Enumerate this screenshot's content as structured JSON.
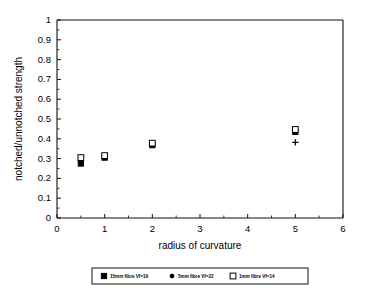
{
  "chart_data": {
    "type": "scatter",
    "title": "",
    "xlabel": "radius of curvature",
    "ylabel": "notched/unnotched strength",
    "xlim": [
      0,
      6
    ],
    "ylim": [
      0,
      1
    ],
    "xticks": [
      0,
      1,
      2,
      3,
      4,
      5,
      6
    ],
    "xticklabels": [
      "0",
      "1",
      "2",
      "3",
      "4",
      "5",
      "6"
    ],
    "yticks": [
      0,
      0.1,
      0.2,
      0.3,
      0.4,
      0.5,
      0.6,
      0.7,
      0.8,
      0.9,
      1
    ],
    "yticklabels": [
      "0",
      "0.1",
      "0.2",
      "0.3",
      "0.4",
      "0.5",
      "0.6",
      "0.7",
      "0.8",
      "0.9",
      "1"
    ],
    "grid": false,
    "legend_position": "below",
    "series": [
      {
        "name": "15mm fibre Vf=19",
        "marker": "square-filled",
        "x": [
          0.5,
          1,
          2,
          5
        ],
        "y": [
          0.275,
          0.305,
          0.368,
          0.435
        ]
      },
      {
        "name": "5mm fibre Vf=22",
        "marker": "dot",
        "x": [
          0.5,
          1,
          2,
          5
        ],
        "y": [
          0.285,
          0.31,
          0.375,
          0.382
        ]
      },
      {
        "name": "1mm fibre Vf=14",
        "marker": "square-open",
        "x": [
          0.5,
          1,
          2,
          5
        ],
        "y": [
          0.305,
          0.315,
          0.378,
          0.447
        ]
      }
    ]
  },
  "legend": {
    "entries": [
      {
        "label": "15mm fibre Vf=19"
      },
      {
        "label": "5mm fibre Vf=22"
      },
      {
        "label": "1mm fibre Vf=14"
      }
    ]
  }
}
